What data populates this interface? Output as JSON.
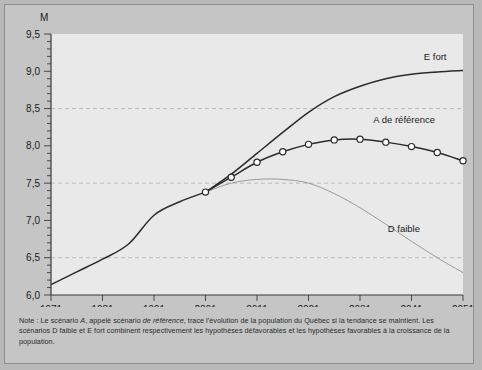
{
  "figure": {
    "unit_label": "M",
    "note_prefix": "Note : Le scénario ",
    "note_a": "A",
    "note_mid1": ", appelé scénario ",
    "note_ref": "de référence",
    "note_mid2": ", trace l'évolution de la population du Québec si la tendance se maintient. Les scénarios D faible et E fort combinent respectivement les hypothèses défavorables et les hypothèses favorables à la croissance de la population.",
    "series_label_e": "E fort",
    "series_label_a": "A de référence",
    "series_label_d": "D faible",
    "colors": {
      "page_background": "#b9b9b9",
      "panel_background": "#c5c5c5",
      "plot_background": "#e9e9e9",
      "line_dark": "#2b2b2b",
      "line_light": "#9a9a9a",
      "grid": "#b5b9a8",
      "axis": "#3a3a3a",
      "marker_fill": "#ffffff"
    }
  },
  "chart_data": {
    "type": "line",
    "title": "",
    "xlabel": "",
    "ylabel": "M",
    "xlim": [
      1971,
      2051
    ],
    "ylim": [
      6.0,
      9.5
    ],
    "ytick_step": 0.5,
    "yminor_step": 0.1,
    "grid": true,
    "gridlines": [
      6.5,
      7.5,
      8.5
    ],
    "legend": "inline-right",
    "xticks": [
      1971,
      1981,
      1991,
      2001,
      2011,
      2021,
      2031,
      2041,
      2051
    ],
    "xtick_labels": [
      "1971",
      "1981",
      "1991",
      "2001",
      "2011",
      "2021",
      "2031",
      "2041",
      "2051"
    ],
    "yticks": [
      6.0,
      6.5,
      7.0,
      7.5,
      8.0,
      8.5,
      9.0,
      9.5
    ],
    "ytick_labels": [
      "6,0",
      "6,5",
      "7,0",
      "7,5",
      "8,0",
      "8,5",
      "9,0",
      "9,5"
    ],
    "series": [
      {
        "name": "Historique",
        "style": "solid-dark",
        "markers": false,
        "x": [
          1971,
          1976,
          1981,
          1986,
          1991,
          1996,
          2001
        ],
        "values": [
          6.14,
          6.31,
          6.48,
          6.68,
          7.07,
          7.25,
          7.38
        ]
      },
      {
        "name": "A de référence",
        "style": "solid-dark-markers",
        "markers": true,
        "x": [
          2001,
          2006,
          2011,
          2016,
          2021,
          2026,
          2031,
          2036,
          2041,
          2046,
          2051
        ],
        "values": [
          7.38,
          7.58,
          7.78,
          7.92,
          8.02,
          8.08,
          8.09,
          8.05,
          7.99,
          7.91,
          7.8
        ]
      },
      {
        "name": "E fort",
        "style": "solid-dark",
        "markers": false,
        "x": [
          2001,
          2006,
          2011,
          2016,
          2021,
          2026,
          2031,
          2036,
          2041,
          2046,
          2051
        ],
        "values": [
          7.38,
          7.62,
          7.9,
          8.18,
          8.45,
          8.66,
          8.8,
          8.9,
          8.96,
          8.99,
          9.01
        ]
      },
      {
        "name": "D faible",
        "style": "solid-light",
        "markers": false,
        "x": [
          2001,
          2006,
          2011,
          2016,
          2021,
          2026,
          2031,
          2036,
          2041,
          2046,
          2051
        ],
        "values": [
          7.38,
          7.5,
          7.55,
          7.55,
          7.5,
          7.36,
          7.17,
          6.95,
          6.72,
          6.5,
          6.3
        ]
      }
    ]
  }
}
